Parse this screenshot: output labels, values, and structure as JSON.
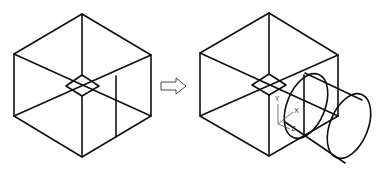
{
  "figure": {
    "left_panel": {
      "name": "original-box"
    },
    "arrow": {
      "direction": "right"
    },
    "right_panel": {
      "name": "box-with-cylinder",
      "ucs_axes": {
        "x_label": "X",
        "y_label": "Y",
        "z_label": "Z"
      }
    }
  }
}
